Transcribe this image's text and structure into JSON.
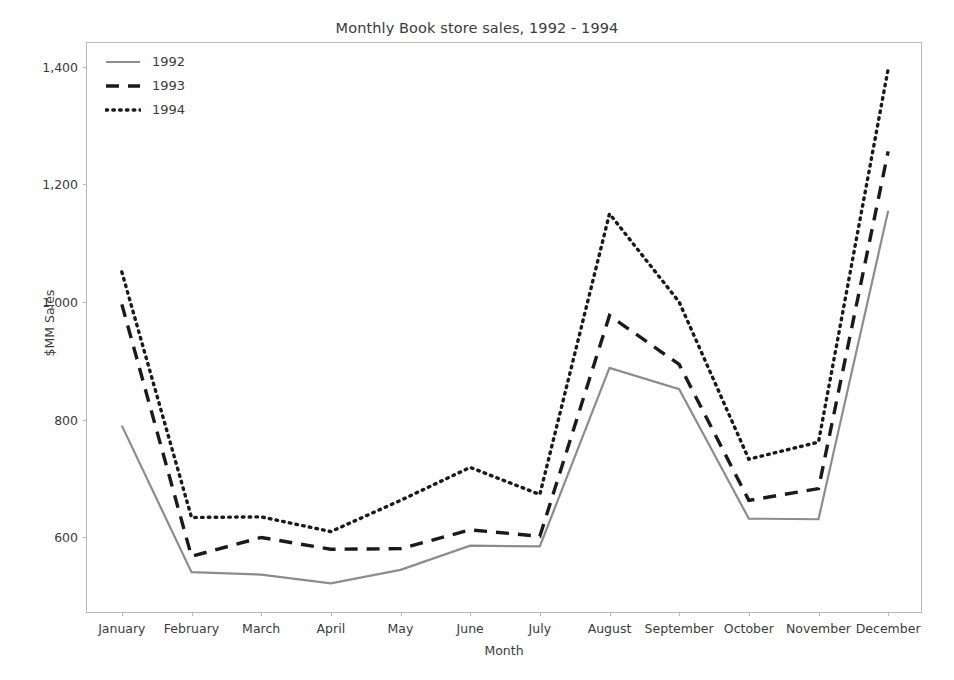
{
  "chart_data": {
    "type": "line",
    "title": "Monthly Book store sales, 1992 - 1994",
    "xlabel": "Month",
    "ylabel": "$MM Sales",
    "categories": [
      "January",
      "February",
      "March",
      "April",
      "May",
      "June",
      "July",
      "August",
      "September",
      "October",
      "November",
      "December"
    ],
    "series": [
      {
        "name": "1992",
        "color": "#8c8c8c",
        "dash": "solid",
        "values": [
          790,
          541,
          537,
          522,
          545,
          586,
          585,
          888,
          852,
          632,
          631,
          1155
        ]
      },
      {
        "name": "1993",
        "color": "#1a1a1a",
        "dash": "dashed",
        "values": [
          996,
          568,
          600,
          580,
          581,
          613,
          602,
          977,
          894,
          663,
          683,
          1256
        ]
      },
      {
        "name": "1994",
        "color": "#1a1a1a",
        "dash": "dotted",
        "values": [
          1051,
          634,
          635,
          610,
          663,
          719,
          673,
          1150,
          1000,
          733,
          762,
          1396
        ]
      }
    ],
    "ylim": [
      470,
      1440
    ],
    "yticks": [
      600,
      800,
      1000,
      1200,
      1400
    ],
    "ytick_labels": [
      "600",
      "800",
      "1,000",
      "1,200",
      "1,400"
    ],
    "grid": false,
    "legend_position": "upper left",
    "legend_entries": [
      "1992",
      "1993",
      "1994"
    ]
  }
}
